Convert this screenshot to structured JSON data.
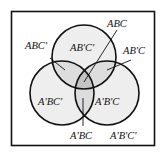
{
  "diagram": {
    "type": "venn",
    "sets": [
      "A",
      "B",
      "C"
    ],
    "colors": {
      "background": "#ffffff",
      "stroke": "#111111",
      "fill_single": "#eeeeee",
      "fill_double": "#dddddd",
      "fill_triple": "#c4c4c4"
    },
    "regions": {
      "abc": "ABC",
      "ab_c_": "ABC'",
      "a_b_c_top": "AB'C'",
      "ab_c": "AB'C",
      "a_bc_": "A'BC'",
      "a_b_c": "A'B'C",
      "a_bc": "A'BC",
      "outside": "A'B'C'"
    }
  }
}
